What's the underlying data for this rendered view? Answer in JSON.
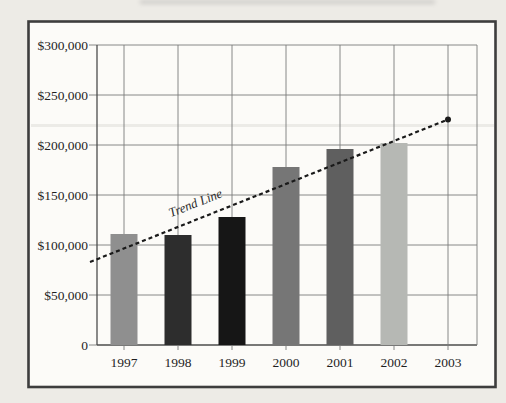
{
  "colors": {
    "page-bg": "#edebe6",
    "frame-fill": "#fcfbf8",
    "frame-border": "#3d3d3d",
    "grid": "#7b7b7b",
    "axis": "#4c4c4c",
    "text": "#1f1f1f",
    "trend": "#1a1a1a"
  },
  "chart_data": {
    "type": "bar",
    "title": "",
    "xlabel": "",
    "ylabel": "",
    "categories": [
      "1997",
      "1998",
      "1999",
      "2000",
      "2001",
      "2002",
      "2003"
    ],
    "series": [
      {
        "name": "bars",
        "values": [
          111000,
          110000,
          128000,
          178000,
          196000,
          202000,
          null
        ]
      }
    ],
    "bar_colors": [
      "#8f8f8f",
      "#2d2d2d",
      "#161616",
      "#767676",
      "#5f5f5f",
      "#b6b8b4",
      null
    ],
    "y_axis": {
      "min": 0,
      "max": 300000,
      "step": 50000,
      "tick_labels": [
        "$300,000",
        "$250,000",
        "$200,000",
        "$150,000",
        "$100,000",
        "$50,000",
        "0"
      ]
    },
    "grid": {
      "horizontal": true,
      "vertical": true
    },
    "legend": {
      "visible": false
    },
    "trend": {
      "label": "Trend Line",
      "start_value": 83000,
      "end_value": 225500,
      "style": "dashed",
      "marker": "dot-at-end"
    }
  }
}
